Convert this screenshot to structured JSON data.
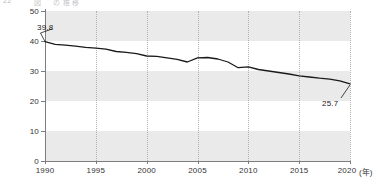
{
  "header": {
    "clipped_text_left": "22",
    "clipped_text_right": "図 　 の 推 移"
  },
  "axes": {
    "y_ticks": [
      "50",
      "40",
      "30",
      "20",
      "10",
      "0"
    ],
    "x_ticks": [
      "1990",
      "1995",
      "2000",
      "2005",
      "2010",
      "2015",
      "2020"
    ],
    "x_unit": "(年)"
  },
  "labels": {
    "start_value": "39.8",
    "end_value": "25.7"
  },
  "colors": {
    "line": "#1a1a1a",
    "band": "#eaeaea",
    "grid": "#b0b0b0",
    "axis": "#7d7d7d"
  },
  "chart_data": {
    "type": "line",
    "title": "",
    "xlabel": "(年)",
    "ylabel": "",
    "xlim": [
      1990,
      2020
    ],
    "ylim": [
      0,
      50
    ],
    "y_ticks": [
      0,
      10,
      20,
      30,
      40,
      50
    ],
    "x_ticks": [
      1990,
      1995,
      2000,
      2005,
      2010,
      2015,
      2020
    ],
    "grid": "vertical dotted at 5-year marks; alternating horizontal shaded bands 0-10, 20-30, 40-50",
    "legend": "none",
    "annotations": [
      {
        "x": 1990,
        "y": 39.8,
        "text": "39.8",
        "position": "above-left with leader line"
      },
      {
        "x": 2020,
        "y": 25.7,
        "text": "25.7",
        "position": "below-left with leader line"
      }
    ],
    "series": [
      {
        "name": "value",
        "x": [
          1990,
          1991,
          1992,
          1993,
          1994,
          1995,
          1996,
          1997,
          1998,
          1999,
          2000,
          2001,
          2002,
          2003,
          2004,
          2005,
          2006,
          2007,
          2008,
          2009,
          2010,
          2011,
          2012,
          2013,
          2014,
          2015,
          2016,
          2017,
          2018,
          2019,
          2020
        ],
        "values": [
          39.8,
          38.9,
          38.6,
          38.3,
          37.9,
          37.6,
          37.3,
          36.5,
          36.2,
          35.8,
          35.0,
          34.9,
          34.4,
          33.9,
          33.0,
          34.4,
          34.5,
          34.0,
          33.0,
          31.1,
          31.4,
          30.5,
          30.0,
          29.5,
          29.0,
          28.4,
          28.0,
          27.6,
          27.3,
          26.7,
          25.7
        ]
      }
    ]
  }
}
